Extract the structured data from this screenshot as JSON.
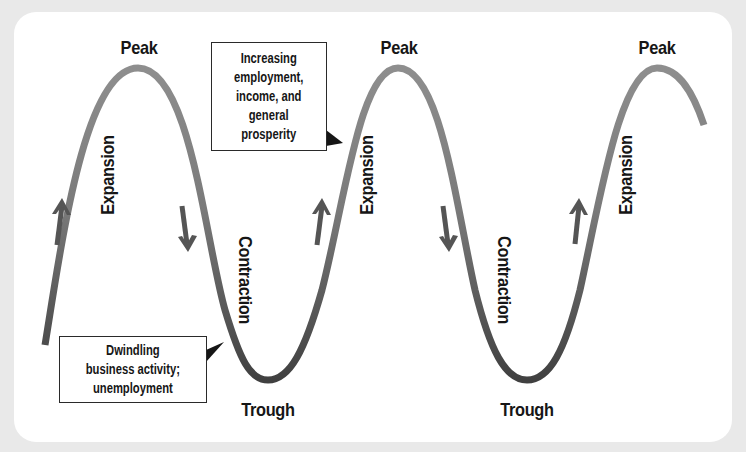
{
  "diagram": {
    "colors": {
      "background": "#e9e9e9",
      "card": "#ffffff",
      "curve_light": "#8c8c8c",
      "curve_dark": "#454545",
      "arrow": "#555555",
      "text": "#161616"
    },
    "peaks": [
      {
        "label": "Peak"
      },
      {
        "label": "Peak"
      },
      {
        "label": "Peak"
      }
    ],
    "troughs": [
      {
        "label": "Trough"
      },
      {
        "label": "Trough"
      }
    ],
    "phases": [
      {
        "label": "Expansion",
        "direction": "up"
      },
      {
        "label": "Contraction",
        "direction": "down"
      },
      {
        "label": "Expansion",
        "direction": "up"
      },
      {
        "label": "Contraction",
        "direction": "down"
      },
      {
        "label": "Expansion",
        "direction": "up"
      }
    ],
    "callouts": [
      {
        "text": "Increasing employment, income, and general prosperity",
        "lines": [
          "Increasing",
          "employment,",
          "income, and",
          "general",
          "prosperity"
        ],
        "points_to": "expansion"
      },
      {
        "text": "Dwindling business activity; unemployment",
        "lines": [
          "Dwindling",
          "business activity;",
          "unemployment"
        ],
        "points_to": "contraction"
      }
    ],
    "icons": {
      "up_arrow": "arrow-up-icon",
      "down_arrow": "arrow-down-icon"
    }
  }
}
